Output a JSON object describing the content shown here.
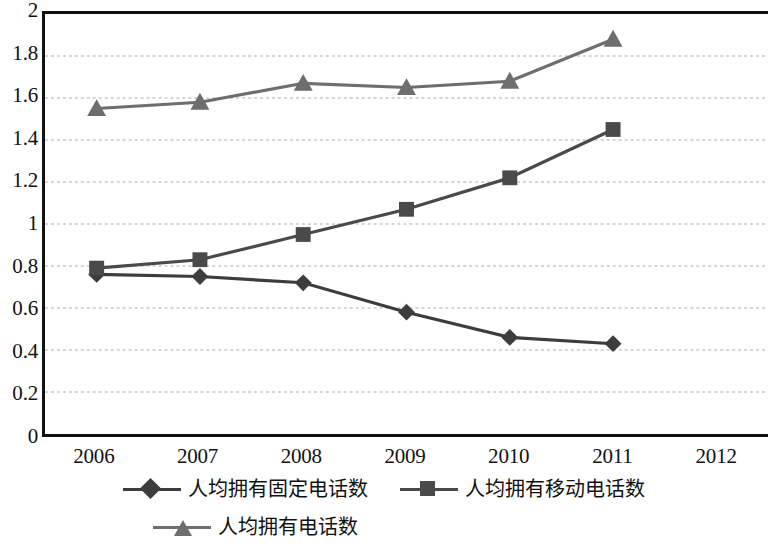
{
  "chart_data": {
    "type": "line",
    "title": "",
    "subtitle": "",
    "xlabel": "",
    "ylabel": "",
    "categories": [
      "2006",
      "2007",
      "2008",
      "2009",
      "2010",
      "2011",
      "2012"
    ],
    "ylim": [
      0,
      2
    ],
    "ytick_step": 0.2,
    "yticks": [
      "2",
      "1.8",
      "1.6",
      "1.4",
      "1.2",
      "1",
      "0.8",
      "0.6",
      "0.4",
      "0.2",
      "0"
    ],
    "grid": true,
    "grid_style": "dashed",
    "grid_color": "#c9c9c9",
    "axis_color": "#111111",
    "legend_position": "bottom",
    "series": [
      {
        "name": "人均拥有固定电话数",
        "marker": "diamond",
        "color": "#3d3d3d",
        "values": [
          0.76,
          0.75,
          0.72,
          0.58,
          0.46,
          0.43,
          null
        ]
      },
      {
        "name": "人均拥有移动电话数",
        "marker": "square",
        "color": "#4a4a4a",
        "values": [
          0.79,
          0.83,
          0.95,
          1.07,
          1.22,
          1.45,
          null
        ]
      },
      {
        "name": "人均拥有电话数",
        "marker": "triangle",
        "color": "#6e6e6e",
        "values": [
          1.55,
          1.58,
          1.67,
          1.65,
          1.68,
          1.88,
          null
        ]
      }
    ]
  }
}
